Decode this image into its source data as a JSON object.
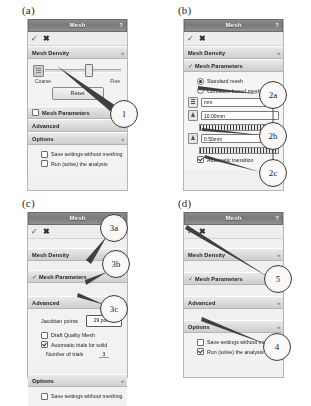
{
  "figure": {
    "panel_labels": [
      "(a)",
      "(b)",
      "(c)",
      "(d)"
    ]
  },
  "dialog": {
    "title": "Mesh",
    "help_glyph": "?",
    "ok_icon": "✓",
    "cancel_icon": "✖",
    "collapse_glyph": "»",
    "expand_glyph": "«",
    "check_glyph": "✓"
  },
  "sections": {
    "mesh_density": "Mesh Density",
    "mesh_parameters": "Mesh Parameters",
    "advanced": "Advanced",
    "options": "Options"
  },
  "panel_a": {
    "slider": {
      "left_label": "Coarse",
      "right_label": "Fine"
    },
    "reset_button": "Reset",
    "options": {
      "save_settings": "Save settings without meshing",
      "run_solve": "Run (solve) the analysis"
    },
    "callout": "1"
  },
  "panel_b": {
    "standard_mesh": "Standard mesh",
    "curvature_mesh": "Curvature based mesh",
    "units_value": "mm",
    "global_size_value": "10.00mm",
    "tolerance_value": "0.50mm",
    "automatic_transition": "Automatic transition",
    "callouts": [
      "2a",
      "2b",
      "2c"
    ]
  },
  "panel_c": {
    "jacobian_label": "Jacobian points",
    "jacobian_value": "29 points",
    "draft_quality": "Draft Quality Mesh",
    "automatic_trials": "Automatic trials for solid",
    "number_of_trials_label": "Number of trials",
    "number_of_trials_value": "3",
    "save_settings": "Save settings without meshing",
    "callouts": [
      "3a",
      "3b",
      "3c"
    ]
  },
  "panel_d": {
    "options": {
      "save_settings": "Save settings without meshing",
      "run_solve": "Run (solve) the analysis"
    },
    "callouts": [
      "5",
      "4"
    ]
  }
}
